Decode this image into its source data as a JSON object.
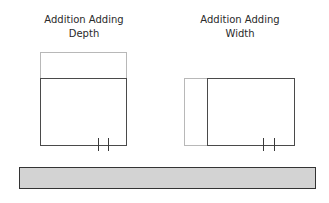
{
  "diagrams": [
    {
      "title_line1": "Addition Adding",
      "title_line2": "Depth"
    },
    {
      "title_line1": "Addition Adding",
      "title_line2": "Width"
    }
  ],
  "colors": {
    "existing_outline": "#4a4a4a",
    "addition_outline": "#b8b8b8",
    "ground_fill": "#d3d3d3"
  }
}
